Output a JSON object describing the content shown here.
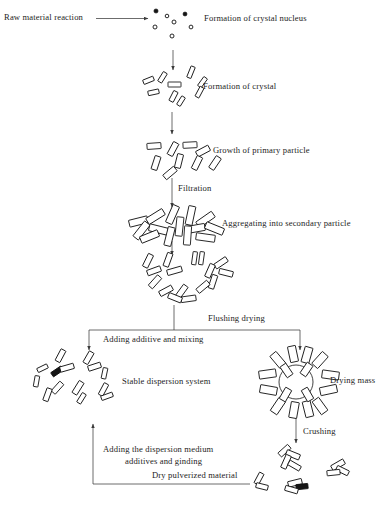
{
  "diagram": {
    "type": "process-flow",
    "background_color": "#ffffff",
    "line_color": "#3b3b3b",
    "shape_fill": "#ffffff",
    "shape_stroke": "#111111"
  },
  "labels": {
    "raw_material": "Raw material   reaction",
    "crystal_nucleus": "Formation of crystal nucleus",
    "crystal_formation": "Formation of crystal",
    "primary_particle": "Growth of primary particle",
    "filtration": "Filtration",
    "secondary_particle": "Aggregating into secondary particle",
    "flushing_drying": "Flushing  drying",
    "adding_additive": "Adding additive and mixing",
    "stable_dispersion": "Stable dispersion system",
    "drying_mass": "Drying mass",
    "crushing": "Crushing",
    "dispersion_medium_line1": "Adding the dispersion medium",
    "dispersion_medium_line2": "additives and ginding",
    "dry_pulverized": "Dry pulverized material"
  },
  "steps": [
    {
      "id": "raw-material",
      "label": "Raw material   reaction",
      "stage": 0
    },
    {
      "id": "crystal-nucleus",
      "label": "Formation of crystal nucleus",
      "stage": 1,
      "particle": "nuclei-dots"
    },
    {
      "id": "crystal-formation",
      "label": "Formation of crystal",
      "stage": 2,
      "particle": "small-rods"
    },
    {
      "id": "primary-particle",
      "label": "Growth of primary particle",
      "stage": 3,
      "particle": "medium-rods"
    },
    {
      "id": "secondary-particle",
      "label": "Aggregating into secondary particle",
      "stage": 4,
      "particle": "dense-aggregate"
    },
    {
      "id": "washed-cluster",
      "label": "",
      "stage": 5,
      "particle": "loose-ring-cluster"
    },
    {
      "id": "stable-dispersion",
      "label": "Stable dispersion system",
      "stage": 6,
      "particle": "dispersed-rods"
    },
    {
      "id": "drying-mass",
      "label": "Drying mass",
      "stage": 6,
      "particle": "radial-cluster"
    },
    {
      "id": "dry-pulverized",
      "label": "Dry pulverized material",
      "stage": 7,
      "particle": "fragments"
    }
  ],
  "transitions": [
    {
      "id": "reaction",
      "label": "",
      "from": "raw-material",
      "to": "crystal-nucleus",
      "direction": "right"
    },
    {
      "id": "nucleation-growth",
      "label": "",
      "from": "crystal-nucleus",
      "to": "crystal-formation",
      "direction": "down"
    },
    {
      "id": "growth",
      "label": "",
      "from": "crystal-formation",
      "to": "primary-particle",
      "direction": "down"
    },
    {
      "id": "filtration",
      "label": "Filtration",
      "from": "primary-particle",
      "to": "secondary-particle",
      "direction": "down"
    },
    {
      "id": "aggregation",
      "label": "",
      "from": "secondary-particle",
      "to": "washed-cluster",
      "direction": "down"
    },
    {
      "id": "flushing-drying",
      "label": "Flushing  drying",
      "from": "washed-cluster",
      "to": "drying-mass",
      "direction": "branch-right"
    },
    {
      "id": "adding-additive",
      "label": "Adding additive and mixing",
      "from": "washed-cluster",
      "to": "stable-dispersion",
      "direction": "branch-left"
    },
    {
      "id": "crushing",
      "label": "Crushing",
      "from": "drying-mass",
      "to": "dry-pulverized",
      "direction": "down"
    },
    {
      "id": "regrinding",
      "label": "Adding the dispersion medium additives and ginding",
      "from": "dry-pulverized",
      "to": "stable-dispersion",
      "direction": "return-up-left"
    }
  ]
}
